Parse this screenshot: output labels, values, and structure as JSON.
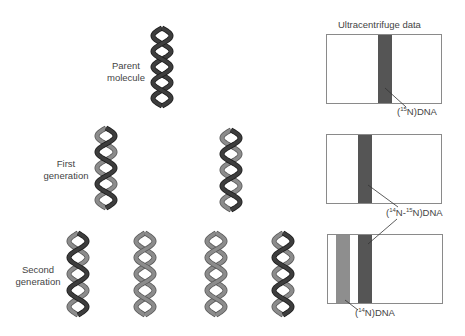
{
  "title": "Ultracentrifuge data",
  "colors": {
    "heavy_strand": "#3d3d3d",
    "heavy_strand_edge": "#1e1e1e",
    "light_strand": "#8c8c8c",
    "light_strand_edge": "#5a5a5a",
    "heavy_band": "#555555",
    "light_band": "#8e8e8e",
    "box_border": "#8a8a8a"
  },
  "rows": [
    {
      "id": "parent",
      "label_lines": [
        "Parent",
        "molecule"
      ],
      "molecules": [
        {
          "strands": [
            "heavy",
            "heavy"
          ]
        }
      ],
      "bands": [
        {
          "type": "heavy",
          "label_main": "N)DNA",
          "label_prefix": "(",
          "sup1": "15",
          "mid": "",
          "sup2": ""
        }
      ]
    },
    {
      "id": "first",
      "label_lines": [
        "First",
        "generation"
      ],
      "molecules": [
        {
          "strands": [
            "heavy",
            "light"
          ]
        },
        {
          "strands": [
            "heavy",
            "light"
          ]
        }
      ],
      "bands": [
        {
          "type": "hybrid"
        }
      ]
    },
    {
      "id": "second",
      "label_lines": [
        "Second",
        "generation"
      ],
      "molecules": [
        {
          "strands": [
            "heavy",
            "light"
          ]
        },
        {
          "strands": [
            "light",
            "light"
          ]
        },
        {
          "strands": [
            "light",
            "light"
          ]
        },
        {
          "strands": [
            "heavy",
            "light"
          ]
        }
      ],
      "bands": [
        {
          "type": "light"
        },
        {
          "type": "hybrid"
        }
      ]
    }
  ],
  "band_labels": {
    "n15": {
      "open": "(",
      "sup": "15",
      "rest": "N)DNA"
    },
    "hybrid": {
      "open": "(",
      "sup_a": "14",
      "mid": "N-",
      "sup_b": "15",
      "rest": "N)DNA"
    },
    "n14": {
      "open": "(",
      "sup": "14",
      "rest": "N)DNA"
    }
  }
}
